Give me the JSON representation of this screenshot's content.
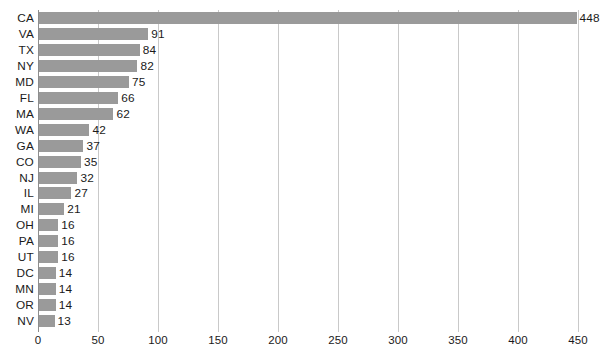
{
  "chart_data": {
    "type": "bar",
    "orientation": "horizontal",
    "title": "",
    "xlabel": "",
    "ylabel": "",
    "categories": [
      "CA",
      "VA",
      "TX",
      "NY",
      "MD",
      "FL",
      "MA",
      "WA",
      "GA",
      "CO",
      "NJ",
      "IL",
      "MI",
      "OH",
      "PA",
      "UT",
      "DC",
      "MN",
      "OR",
      "NV"
    ],
    "values": [
      448,
      91,
      84,
      82,
      75,
      66,
      62,
      42,
      37,
      35,
      32,
      27,
      21,
      16,
      16,
      16,
      14,
      14,
      14,
      13
    ],
    "xlim": [
      0,
      450
    ],
    "xticks": [
      0,
      50,
      100,
      150,
      200,
      250,
      300,
      350,
      400,
      450
    ],
    "xtick_labels": [
      "0",
      "50",
      "100",
      "150",
      "200",
      "250",
      "300",
      "350",
      "400",
      "450"
    ],
    "grid": "vertical",
    "legend": "none",
    "data_labels": true,
    "bar_color": "#9a9a9a",
    "gridline_color": "#c9c9c9",
    "axis_color": "#8d8d8d",
    "text_color": "#1a1a1a",
    "background": "#ffffff"
  }
}
